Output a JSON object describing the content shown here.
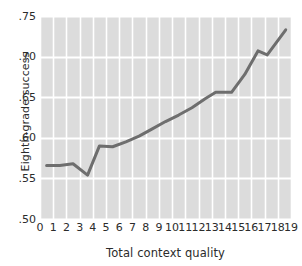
{
  "chart_data": {
    "type": "line",
    "title": "",
    "xlabel": "Total context quality",
    "ylabel": "Eighth-grade success",
    "xlim": [
      0,
      19
    ],
    "ylim": [
      0.5,
      0.75
    ],
    "xticks": [
      "0",
      "1",
      "2",
      "3",
      "4",
      "5",
      "6",
      "7",
      "8",
      "9",
      "10",
      "11",
      "12",
      "13",
      "14",
      "15",
      "16",
      "17",
      "18",
      "19"
    ],
    "xtick_values": [
      0,
      1,
      2,
      3,
      4,
      5,
      6,
      7,
      8,
      9,
      10,
      11,
      12,
      13,
      14,
      15,
      16,
      17,
      18,
      19
    ],
    "yticks": [
      ".50",
      ".55",
      ".60",
      ".65",
      ".70",
      ".75"
    ],
    "ytick_values": [
      0.5,
      0.55,
      0.6,
      0.65,
      0.7,
      0.75
    ],
    "grid": "both",
    "grid_color": "#ffffff",
    "plot_background": "#dcdcdc",
    "line_color": "#6e6e6e",
    "line_width": 3,
    "legend": "none",
    "series": [
      {
        "name": "Eighth-grade success",
        "x": [
          0.5,
          1.5,
          2.5,
          3.6,
          4.5,
          5.5,
          6.5,
          7.5,
          8.5,
          9.5,
          10.5,
          11.5,
          12.5,
          13.3,
          14.5,
          15.5,
          16.5,
          17.2,
          18.6
        ],
        "values": [
          0.566,
          0.566,
          0.568,
          0.554,
          0.59,
          0.589,
          0.595,
          0.602,
          0.611,
          0.62,
          0.628,
          0.637,
          0.648,
          0.656,
          0.656,
          0.678,
          0.707,
          0.702,
          0.733
        ]
      }
    ]
  }
}
